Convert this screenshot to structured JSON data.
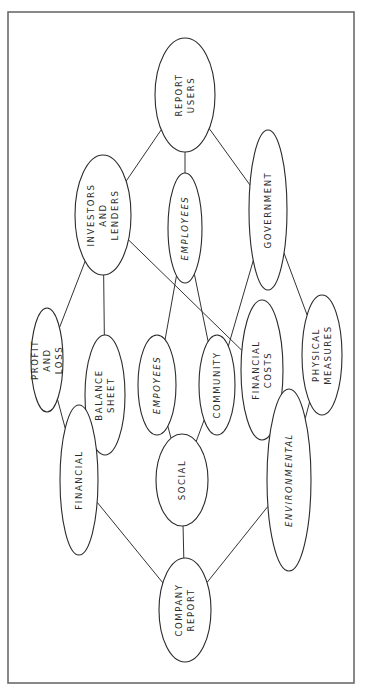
{
  "diagram": {
    "type": "hand-drawn hierarchy / tree",
    "orientation": "rotated 90 degrees (text reads bottom-to-top)",
    "nodes": [
      {
        "id": "report-users",
        "lines": [
          "REPORT",
          "USERS"
        ]
      },
      {
        "id": "investors-lenders",
        "lines": [
          "INVESTORS",
          "AND",
          "LENDERS"
        ]
      },
      {
        "id": "employees-top",
        "lines": [
          "EMPLOYEES"
        ],
        "italic": true
      },
      {
        "id": "government",
        "lines": [
          "GOVERNMENT"
        ]
      },
      {
        "id": "profit-loss",
        "lines": [
          "PROFIT",
          "AND",
          "LOSS"
        ]
      },
      {
        "id": "balance-sheet",
        "lines": [
          "BALANCE",
          "SHEET"
        ]
      },
      {
        "id": "employees-social",
        "lines": [
          "EMPOYEES"
        ],
        "italic": true
      },
      {
        "id": "community",
        "lines": [
          "COMMUNITY"
        ]
      },
      {
        "id": "financial-costs",
        "lines": [
          "FINANCIAL",
          "COSTS"
        ]
      },
      {
        "id": "physical-measures",
        "lines": [
          "PHYSICAL",
          "MEASURES"
        ]
      },
      {
        "id": "financial",
        "lines": [
          "FINANCIAL"
        ]
      },
      {
        "id": "social",
        "lines": [
          "SOCIAL"
        ]
      },
      {
        "id": "environmental",
        "lines": [
          "ENVIRONMENTAL"
        ],
        "italic": true
      },
      {
        "id": "company-report",
        "lines": [
          "COMPANY",
          "REPORT"
        ]
      }
    ],
    "edges": [
      [
        "report-users",
        "investors-lenders"
      ],
      [
        "report-users",
        "employees-top"
      ],
      [
        "report-users",
        "government"
      ],
      [
        "investors-lenders",
        "profit-loss"
      ],
      [
        "investors-lenders",
        "balance-sheet"
      ],
      [
        "investors-lenders",
        "financial-costs"
      ],
      [
        "employees-top",
        "employees-social"
      ],
      [
        "employees-top",
        "community"
      ],
      [
        "government",
        "community"
      ],
      [
        "government",
        "physical-measures"
      ],
      [
        "profit-loss",
        "financial"
      ],
      [
        "employees-social",
        "social"
      ],
      [
        "community",
        "social"
      ],
      [
        "financial-costs",
        "environmental"
      ],
      [
        "physical-measures",
        "environmental"
      ],
      [
        "financial",
        "company-report"
      ],
      [
        "social",
        "company-report"
      ],
      [
        "environmental",
        "company-report"
      ]
    ]
  }
}
